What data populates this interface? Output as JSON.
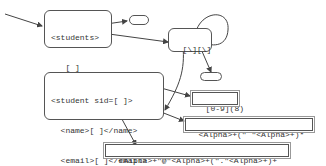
{
  "diagram": {
    "students_box": {
      "lines": [
        "<students>",
        "   [ ]",
        "</sudents>"
      ]
    },
    "regex_group_box": {
      "label": "[\\][\\]"
    },
    "student_box": {
      "lines": [
        "<student sid=[ ]>",
        "  <name>[ ]</name>",
        "  <email>[ ]</email>",
        "</student>"
      ]
    },
    "pattern_sid": {
      "label": "[0-9](8)"
    },
    "pattern_name": {
      "label": "<Alpha>+(\" \"<Alpha>+)*"
    },
    "pattern_email": {
      "label": "<Alpha>+\"@\"<Alpha>+(\".\"<Alpha>+)+"
    },
    "colors": {
      "stroke": "#555555",
      "text": "#333333",
      "background": "#ffffff"
    }
  }
}
